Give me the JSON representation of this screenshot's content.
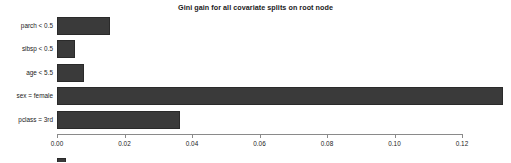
{
  "chart_data": {
    "type": "bar",
    "orientation": "horizontal",
    "title": "Gini gain for all covariate splits on root node",
    "xlabel": "",
    "ylabel": "",
    "categories": [
      "parch < 0.5",
      "sibsp < 0.5",
      "age < 5.5",
      "sex = female",
      "pclass = 3rd"
    ],
    "values": [
      0.0157,
      0.0053,
      0.008,
      0.132,
      0.0364
    ],
    "xlim": [
      0.0,
      0.1276
    ],
    "xticks": [
      0.0,
      0.02,
      0.04,
      0.06,
      0.08,
      0.1,
      0.12
    ],
    "xtick_labels": [
      "0.00",
      "0.02",
      "0.04",
      "0.06",
      "0.08",
      "0.10",
      "0.12"
    ],
    "grid": false,
    "legend_position": "bottom-left",
    "legend": [
      ""
    ],
    "series": [
      {
        "name": "Gini gain",
        "color": "#3a3a3a",
        "values": [
          0.0157,
          0.0053,
          0.008,
          0.132,
          0.0364
        ]
      }
    ]
  },
  "axis": {
    "tick_color": "#8a8a8a",
    "text_color": "#1a1a1a"
  }
}
